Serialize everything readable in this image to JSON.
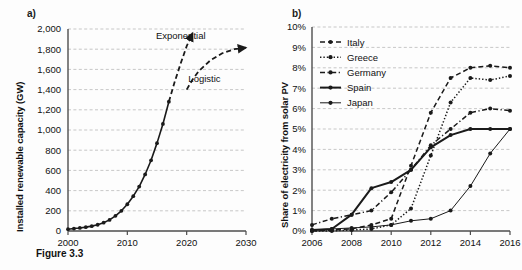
{
  "figure": {
    "caption": "Figure 3.3",
    "panel_a_label": "a)",
    "panel_b_label": "b)"
  },
  "chart_data": [
    {
      "type": "line",
      "panel": "a",
      "title": "",
      "xlabel": "",
      "ylabel": "Installed renewable capacity (GW)",
      "xlim": [
        2000,
        2030
      ],
      "ylim": [
        0,
        2000
      ],
      "xticks": [
        2000,
        2010,
        2020,
        2030
      ],
      "xticklabels": [
        "2000",
        "2010",
        "2020",
        "2030"
      ],
      "yticks": [
        0,
        200,
        400,
        600,
        800,
        1000,
        1200,
        1400,
        1600,
        1800,
        2000
      ],
      "yticklabels": [
        "0",
        "200",
        "400",
        "600",
        "800",
        "1,000",
        "1,200",
        "1,400",
        "1,600",
        "1,800",
        "2,000"
      ],
      "grid": true,
      "grid_style": "dashed-horizontal",
      "annotations": [
        {
          "text": "Exponential",
          "x": 2019.0,
          "y": 1900
        },
        {
          "text": "Logistic",
          "x": 2023.0,
          "y": 1480
        }
      ],
      "series": [
        {
          "name": "Historical installed capacity",
          "style": "solid",
          "markers": true,
          "x": [
            2000,
            2001,
            2002,
            2003,
            2004,
            2005,
            2006,
            2007,
            2008,
            2009,
            2010,
            2011,
            2012,
            2013,
            2014,
            2015,
            2016,
            2017
          ],
          "values": [
            18,
            24,
            30,
            38,
            48,
            62,
            82,
            110,
            150,
            200,
            265,
            345,
            440,
            560,
            700,
            870,
            1060,
            1280
          ]
        },
        {
          "name": "Exponential projection",
          "style": "dashed",
          "markers": false,
          "arrow": true,
          "x": [
            2017,
            2018,
            2019,
            2020,
            2021
          ],
          "values": [
            1280,
            1480,
            1660,
            1830,
            1960
          ]
        },
        {
          "name": "Logistic projection",
          "style": "dashed",
          "markers": false,
          "arrow": true,
          "x": [
            2020,
            2021,
            2022,
            2024,
            2026,
            2028,
            2030
          ],
          "values": [
            1400,
            1500,
            1580,
            1690,
            1760,
            1800,
            1815
          ]
        }
      ]
    },
    {
      "type": "line",
      "panel": "b",
      "title": "",
      "xlabel": "",
      "ylabel": "Share of electricity from solar PV",
      "xlim": [
        2006,
        2016
      ],
      "ylim": [
        0,
        10
      ],
      "unit": "%",
      "xticks": [
        2006,
        2008,
        2010,
        2012,
        2014,
        2016
      ],
      "xticklabels": [
        "2006",
        "2008",
        "2010",
        "2012",
        "2014",
        "2016"
      ],
      "yticks": [
        0,
        1,
        2,
        3,
        4,
        5,
        6,
        7,
        8,
        9,
        10
      ],
      "yticklabels": [
        "0%",
        "1%",
        "2%",
        "3%",
        "4%",
        "5%",
        "6%",
        "7%",
        "8%",
        "9%",
        "10%"
      ],
      "grid": true,
      "grid_style": "dashed-horizontal",
      "legend_position": "upper-left",
      "categories": [
        2006,
        2007,
        2008,
        2009,
        2010,
        2011,
        2012,
        2013,
        2014,
        2015,
        2016
      ],
      "series": [
        {
          "name": "Italy",
          "style": "dashed",
          "markers": true,
          "values": [
            0.0,
            0.05,
            0.1,
            0.3,
            0.6,
            3.2,
            5.8,
            7.5,
            8.0,
            8.1,
            8.0
          ]
        },
        {
          "name": "Greece",
          "style": "dotted",
          "markers": true,
          "values": [
            0.0,
            0.0,
            0.05,
            0.1,
            0.3,
            1.1,
            3.7,
            6.3,
            7.5,
            7.4,
            7.6
          ]
        },
        {
          "name": "Germany",
          "style": "dashdot",
          "markers": true,
          "values": [
            0.3,
            0.6,
            0.8,
            1.0,
            1.9,
            3.0,
            4.2,
            5.0,
            5.8,
            6.0,
            5.9
          ]
        },
        {
          "name": "Spain",
          "style": "solid-thick",
          "markers": true,
          "values": [
            0.05,
            0.1,
            0.8,
            2.1,
            2.4,
            3.0,
            4.1,
            4.7,
            5.0,
            5.0,
            5.0
          ]
        },
        {
          "name": "Japan",
          "style": "solid-thin",
          "markers": true,
          "values": [
            0.05,
            0.1,
            0.15,
            0.2,
            0.3,
            0.5,
            0.6,
            1.0,
            2.2,
            3.8,
            5.0
          ]
        }
      ]
    }
  ]
}
